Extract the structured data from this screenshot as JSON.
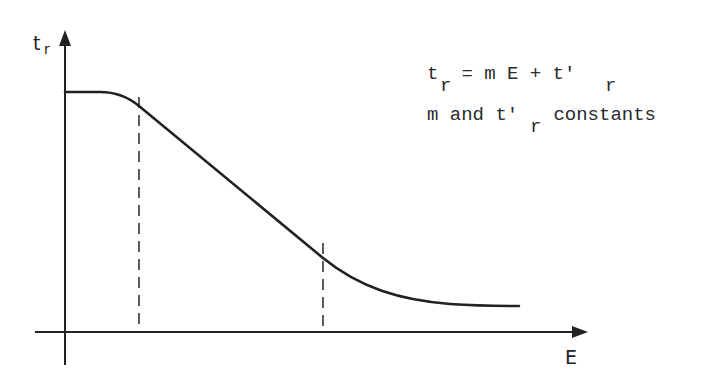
{
  "diagram": {
    "y_axis": {
      "label": "t",
      "label_sub": "r"
    },
    "x_axis": {
      "label": "E"
    },
    "annotation": {
      "line1": {
        "lhs": "t",
        "lhs_sub": "r",
        "middle": " = m E + t'",
        "rhs_sub": "r"
      },
      "line2": {
        "start": "m and t'",
        "sub": "r",
        "end": " constants"
      }
    },
    "curve_description": "t_r plateaus at low E, decreases linearly between two dashed markers, then levels off asymptotically at high E",
    "markers": [
      "linear region start",
      "linear region end"
    ],
    "colors": {
      "ink": "#222222",
      "background": "#ffffff"
    }
  }
}
